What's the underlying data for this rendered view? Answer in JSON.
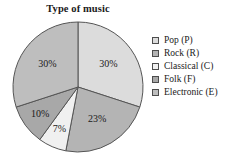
{
  "chart_data": {
    "type": "pie",
    "title": "Type of music",
    "categories": [
      "Pop (P)",
      "Rock (R)",
      "Classical (C)",
      "Folk (F)",
      "Electronic (E)"
    ],
    "values": [
      30,
      23,
      7,
      10,
      30
    ],
    "value_labels": [
      "30%",
      "23%",
      "7%",
      "10%",
      "30%"
    ],
    "colors": [
      "#dcdcdc",
      "#b4b4b4",
      "#f0f0f0",
      "#a8a8a8",
      "#bebebe"
    ],
    "start_angle_deg": 0,
    "direction": "clockwise",
    "legend_position": "right",
    "grid": false,
    "xlabel": "",
    "ylabel": ""
  },
  "legend": {
    "items": [
      {
        "label": "Pop (P)",
        "color": "#dcdcdc"
      },
      {
        "label": "Rock (R)",
        "color": "#b4b4b4"
      },
      {
        "label": "Classical (C)",
        "color": "#f0f0f0"
      },
      {
        "label": "Folk (F)",
        "color": "#a8a8a8"
      },
      {
        "label": "Electronic (E)",
        "color": "#bebebe"
      }
    ]
  },
  "pie_geometry": {
    "cx": 78,
    "cy": 87,
    "r": 65,
    "stroke": "#555555"
  }
}
